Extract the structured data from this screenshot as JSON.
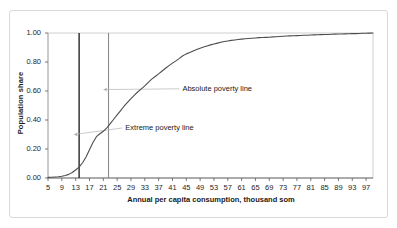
{
  "figure": {
    "background_color": "#ffffff",
    "frame_color": "#d8d8d8",
    "axis_color": "#595959",
    "gridline_color": "#bfbfbf",
    "series_color": "#4d4d4d",
    "extreme_line_color": "#262626",
    "absolute_line_color": "#8c8c8c",
    "leader_color": "#b3b3b3"
  },
  "chart_data": {
    "type": "line",
    "title": "",
    "xlabel": "Annual per capita consumption, thousand som",
    "ylabel": "Population share",
    "xlim": [
      5,
      99
    ],
    "ylim": [
      0.0,
      1.0
    ],
    "grid": false,
    "legend": "none",
    "x_ticks": [
      5,
      9,
      13,
      17,
      21,
      25,
      29,
      33,
      37,
      41,
      45,
      49,
      53,
      57,
      61,
      65,
      69,
      73,
      77,
      81,
      85,
      89,
      93,
      97
    ],
    "x_tick_labels": [
      "5",
      "9",
      "13",
      "17",
      "21",
      "25",
      "29",
      "33",
      "37",
      "41",
      "45",
      "49",
      "53",
      "57",
      "61",
      "65",
      "69",
      "73",
      "77",
      "81",
      "85",
      "89",
      "93",
      "97"
    ],
    "y_ticks": [
      0.0,
      0.2,
      0.4,
      0.6,
      0.8,
      1.0
    ],
    "y_tick_labels": [
      "0.00",
      "0.20",
      "0.40",
      "0.60",
      "0.80",
      "1.00"
    ],
    "series": [
      {
        "name": "Cumulative population share",
        "x": [
          5,
          6,
          7,
          8,
          9,
          10,
          11,
          12,
          13,
          14,
          15,
          16,
          17,
          18,
          19,
          20,
          21,
          22,
          23,
          24,
          25,
          26,
          27,
          28,
          29,
          30,
          31,
          32,
          33,
          34,
          35,
          36,
          37,
          38,
          39,
          40,
          41,
          42,
          43,
          44,
          45,
          46,
          47,
          48,
          49,
          50,
          51,
          52,
          53,
          54,
          55,
          56,
          57,
          58,
          59,
          60,
          61,
          62,
          63,
          64,
          65,
          66,
          67,
          68,
          69,
          70,
          71,
          72,
          73,
          74,
          75,
          76,
          77,
          78,
          79,
          80,
          81,
          82,
          83,
          84,
          85,
          86,
          87,
          88,
          89,
          90,
          91,
          92,
          93,
          94,
          95,
          96,
          97,
          98,
          99
        ],
        "values": [
          0.004,
          0.005,
          0.007,
          0.009,
          0.012,
          0.017,
          0.025,
          0.038,
          0.055,
          0.075,
          0.105,
          0.145,
          0.195,
          0.245,
          0.285,
          0.305,
          0.322,
          0.345,
          0.375,
          0.405,
          0.435,
          0.465,
          0.495,
          0.522,
          0.548,
          0.572,
          0.595,
          0.615,
          0.635,
          0.66,
          0.682,
          0.7,
          0.718,
          0.738,
          0.757,
          0.775,
          0.792,
          0.808,
          0.825,
          0.843,
          0.856,
          0.866,
          0.876,
          0.886,
          0.895,
          0.903,
          0.911,
          0.918,
          0.924,
          0.93,
          0.936,
          0.941,
          0.945,
          0.949,
          0.952,
          0.955,
          0.958,
          0.96,
          0.962,
          0.964,
          0.966,
          0.968,
          0.969,
          0.97,
          0.971,
          0.973,
          0.974,
          0.976,
          0.978,
          0.979,
          0.98,
          0.981,
          0.982,
          0.983,
          0.984,
          0.985,
          0.986,
          0.987,
          0.988,
          0.989,
          0.99,
          0.99,
          0.991,
          0.992,
          0.993,
          0.993,
          0.994,
          0.995,
          0.996,
          0.996,
          0.997,
          0.998,
          0.998,
          0.999,
          1.0
        ]
      }
    ],
    "annotations": [
      {
        "id": "extreme-poverty-line",
        "label": "Extreme poverty line",
        "x_value": 14,
        "marker_y": 0.3,
        "label_x": 26.5,
        "label_y": 0.345,
        "line_style": "vertical-rule-dark"
      },
      {
        "id": "absolute-poverty-line",
        "label": "Absolute poverty line",
        "x_value": 22.5,
        "marker_y": 0.61,
        "label_x": 43.0,
        "label_y": 0.615,
        "line_style": "vertical-rule-light"
      }
    ]
  }
}
